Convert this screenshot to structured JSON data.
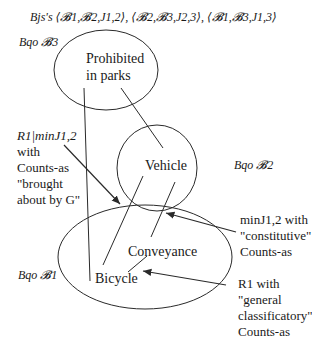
{
  "title": "Bjs's ⟨𝓑1,𝓑2,J1,2⟩, ⟨𝓑2,𝓑3,J2,3⟩, ⟨𝓑1,𝓑3,J1,3⟩",
  "sets": [
    {
      "id": "B3",
      "label": "Bqo 𝓑3",
      "node_lines": [
        "Prohibited",
        "in parks"
      ]
    },
    {
      "id": "B2",
      "label": "Bqo 𝓑2",
      "node_lines": [
        "Vehicle"
      ]
    },
    {
      "id": "B1",
      "label": "Bqo 𝓑1",
      "node_lines": [
        "Conveyance",
        "Bicycle"
      ]
    }
  ],
  "nodes": {
    "prohibited_line1": "Prohibited",
    "prohibited_line2": "in parks",
    "vehicle": "Vehicle",
    "conveyance": "Conveyance",
    "bicycle": "Bicycle"
  },
  "annotations": [
    {
      "id": "brought-about",
      "lines": [
        "R1|minJ1,2",
        "with",
        "Counts-as",
        "\"brought",
        "about by G\""
      ]
    },
    {
      "id": "constitutive",
      "lines": [
        "minJ1,2 with",
        "\"constitutive\"",
        "Counts-as"
      ]
    },
    {
      "id": "general-classificatory",
      "lines": [
        "R1 with",
        "\"general",
        "classificatory\"",
        "Counts-as"
      ]
    }
  ],
  "labels": {
    "bqo3": "Bqo 𝓑3",
    "bqo2": "Bqo 𝓑2",
    "bqo1": "Bqo 𝓑1"
  },
  "colors": {
    "stroke": "#2a2a2a",
    "text": "#1a1a1a",
    "background": "#ffffff"
  }
}
